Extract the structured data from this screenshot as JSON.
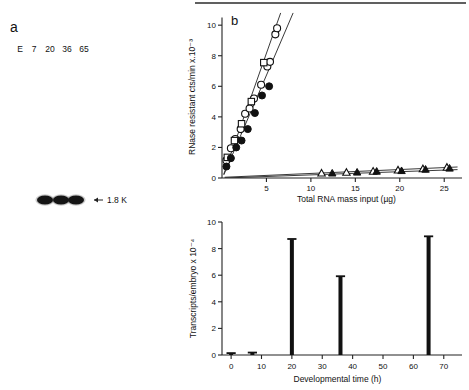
{
  "figure": {
    "top_rule": true,
    "panel_a": {
      "label": "a",
      "lane_labels": [
        "E",
        "7",
        "20",
        "36",
        "65"
      ],
      "band_marker_label": "1.8 K",
      "band_marker_arrow": "←",
      "bands": [
        {
          "lane": "20",
          "visible": true
        },
        {
          "lane": "36",
          "visible": true
        },
        {
          "lane": "65",
          "visible": true
        }
      ]
    },
    "panel_b": {
      "label": "b"
    }
  },
  "chart_data": [
    {
      "id": "panel_b_scatter",
      "type": "scatter",
      "title": "b",
      "xlabel": "Total RNA mass input (µg)",
      "ylabel": "RNase resistant cts/min x.10⁻³",
      "xlim": [
        0,
        27
      ],
      "ylim": [
        0,
        10.6
      ],
      "xticks": [
        5,
        10,
        15,
        20,
        25
      ],
      "xtick_labels": [
        "5",
        "10",
        "15",
        "20",
        "25"
      ],
      "yticks": [
        0,
        2,
        4,
        6,
        8,
        10
      ],
      "ytick_labels": [
        "0",
        "2",
        "4",
        "6",
        "8",
        "10"
      ],
      "grid": false,
      "legend": "none",
      "series": [
        {
          "name": "open-circle-steep",
          "marker": "open-circle",
          "fit_line": {
            "x0": 0.2,
            "y0": 0.25,
            "x1": 6.6,
            "y1": 10.8
          },
          "points": [
            {
              "x": 0.5,
              "y": 1.15
            },
            {
              "x": 1.0,
              "y": 1.95
            },
            {
              "x": 1.5,
              "y": 2.55
            },
            {
              "x": 2.1,
              "y": 3.2
            },
            {
              "x": 2.6,
              "y": 4.2
            },
            {
              "x": 3.1,
              "y": 4.55
            },
            {
              "x": 3.6,
              "y": 5.2
            },
            {
              "x": 4.4,
              "y": 6.1
            },
            {
              "x": 5.1,
              "y": 7.3
            },
            {
              "x": 5.4,
              "y": 7.6
            },
            {
              "x": 6.0,
              "y": 9.4
            },
            {
              "x": 6.2,
              "y": 9.8
            }
          ]
        },
        {
          "name": "open-square-steep",
          "marker": "open-square",
          "points": [
            {
              "x": 0.6,
              "y": 1.35
            },
            {
              "x": 1.4,
              "y": 2.45
            },
            {
              "x": 2.2,
              "y": 3.55
            },
            {
              "x": 3.3,
              "y": 5.0
            },
            {
              "x": 4.7,
              "y": 7.55
            }
          ]
        },
        {
          "name": "filled-circle-shallow",
          "marker": "filled-circle",
          "fit_line": {
            "x0": 0.2,
            "y0": 0.2,
            "x1": 8.0,
            "y1": 10.8
          },
          "points": [
            {
              "x": 0.5,
              "y": 0.75
            },
            {
              "x": 1.0,
              "y": 1.3
            },
            {
              "x": 1.6,
              "y": 2.0
            },
            {
              "x": 2.2,
              "y": 2.45
            },
            {
              "x": 2.9,
              "y": 3.2
            },
            {
              "x": 3.7,
              "y": 4.25
            },
            {
              "x": 4.5,
              "y": 5.4
            },
            {
              "x": 5.3,
              "y": 6.0
            }
          ]
        },
        {
          "name": "open-triangle-baseline",
          "marker": "open-triangle",
          "fit_line": {
            "x0": 0.3,
            "y0": 0.05,
            "x1": 26.5,
            "y1": 0.72
          },
          "points": [
            {
              "x": 11.2,
              "y": 0.3
            },
            {
              "x": 14.0,
              "y": 0.35
            },
            {
              "x": 17.0,
              "y": 0.42
            },
            {
              "x": 19.8,
              "y": 0.5
            },
            {
              "x": 22.6,
              "y": 0.58
            },
            {
              "x": 25.3,
              "y": 0.68
            }
          ]
        },
        {
          "name": "filled-triangle-baseline",
          "marker": "filled-triangle",
          "fit_line": {
            "x0": 0.3,
            "y0": 0.0,
            "x1": 26.5,
            "y1": 0.55
          },
          "points": [
            {
              "x": 12.4,
              "y": 0.3
            },
            {
              "x": 15.2,
              "y": 0.36
            },
            {
              "x": 17.4,
              "y": 0.42
            },
            {
              "x": 20.2,
              "y": 0.46
            },
            {
              "x": 22.9,
              "y": 0.55
            },
            {
              "x": 25.6,
              "y": 0.62
            }
          ]
        }
      ]
    },
    {
      "id": "panel_b_bars",
      "type": "bar",
      "xlabel": "Developmental time (h)",
      "ylabel": "Transcripts/embryo x 10⁻⁴",
      "xlim": [
        -3,
        76
      ],
      "ylim": [
        0,
        10
      ],
      "xticks": [
        0,
        10,
        20,
        30,
        40,
        50,
        60,
        70
      ],
      "xtick_labels": [
        "0",
        "10",
        "20",
        "30",
        "40",
        "50",
        "60",
        "70"
      ],
      "yticks": [
        0,
        2,
        4,
        6,
        8,
        10
      ],
      "ytick_labels": [
        "0",
        "2",
        "4",
        "6",
        "8",
        "10"
      ],
      "grid": false,
      "legend": "none",
      "categories": [
        0,
        7,
        20,
        36,
        65
      ],
      "values": [
        0.12,
        0.16,
        8.7,
        5.9,
        8.9
      ]
    }
  ]
}
